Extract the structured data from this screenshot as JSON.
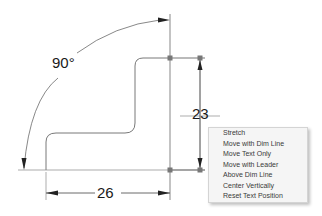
{
  "drawing": {
    "angle_dimension": {
      "value": "90°"
    },
    "horizontal_dimension": {
      "value": "26"
    },
    "vertical_dimension": {
      "value": "23"
    },
    "colors": {
      "geometry": "#555555",
      "dimension": "#333333",
      "grip": "#777777",
      "menu_bg": "#f5f5f5",
      "menu_text": "#3a3a3a"
    }
  },
  "context_menu": {
    "items": [
      {
        "label": "Stretch"
      },
      {
        "label": "Move with Dim Line"
      },
      {
        "label": "Move Text Only"
      },
      {
        "label": "Move with Leader"
      },
      {
        "label": "Above Dim Line"
      },
      {
        "label": "Center Vertically"
      },
      {
        "label": "Reset Text Position"
      }
    ]
  }
}
